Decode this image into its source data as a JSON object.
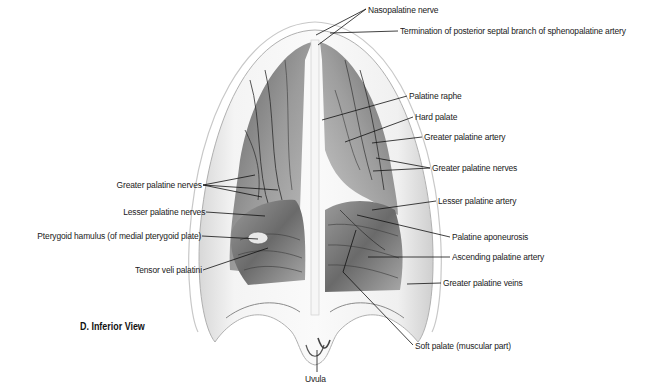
{
  "figure": {
    "view_title": "D. Inferior View",
    "labels_right": [
      {
        "id": "nasopalatine-nerve",
        "text": "Nasopalatine nerve",
        "x": 368,
        "y": 4
      },
      {
        "id": "posterior-septal-termination",
        "text": "Termination of posterior septal branch of sphenopalatine artery",
        "x": 400,
        "y": 25
      },
      {
        "id": "palatine-raphe",
        "text": "Palatine raphe",
        "x": 409,
        "y": 90
      },
      {
        "id": "hard-palate",
        "text": "Hard palate",
        "x": 415,
        "y": 111
      },
      {
        "id": "greater-palatine-artery",
        "text": "Greater palatine artery",
        "x": 424,
        "y": 131
      },
      {
        "id": "greater-palatine-nerves-right",
        "text": "Greater palatine nerves",
        "x": 432,
        "y": 163
      },
      {
        "id": "lesser-palatine-artery",
        "text": "Lesser palatine artery",
        "x": 438,
        "y": 196
      },
      {
        "id": "palatine-aponeurosis",
        "text": "Palatine aponeurosis",
        "x": 452,
        "y": 232
      },
      {
        "id": "ascending-palatine-artery",
        "text": "Ascending palatine artery",
        "x": 452,
        "y": 252
      },
      {
        "id": "greater-palatine-veins",
        "text": "Greater palatine veins",
        "x": 443,
        "y": 278
      },
      {
        "id": "soft-palate-muscular",
        "text": "Soft palate (muscular part)",
        "x": 415,
        "y": 342
      }
    ],
    "labels_left": [
      {
        "id": "greater-palatine-nerves-left",
        "text": "Greater palatine nerves",
        "right": 460,
        "y": 180
      },
      {
        "id": "lesser-palatine-nerves",
        "text": "Lesser palatine nerves",
        "right": 457,
        "y": 207
      },
      {
        "id": "pterygoid-hamulus",
        "text": "Pterygoid hamulus (of medial pterygoid plate)",
        "right": 461,
        "y": 231
      },
      {
        "id": "tensor-veli-palatini",
        "text": "Tensor veli palatini",
        "right": 461,
        "y": 264
      }
    ],
    "label_bottom": {
      "id": "uvula",
      "text": "Uvula",
      "x": 305,
      "y": 375
    }
  }
}
